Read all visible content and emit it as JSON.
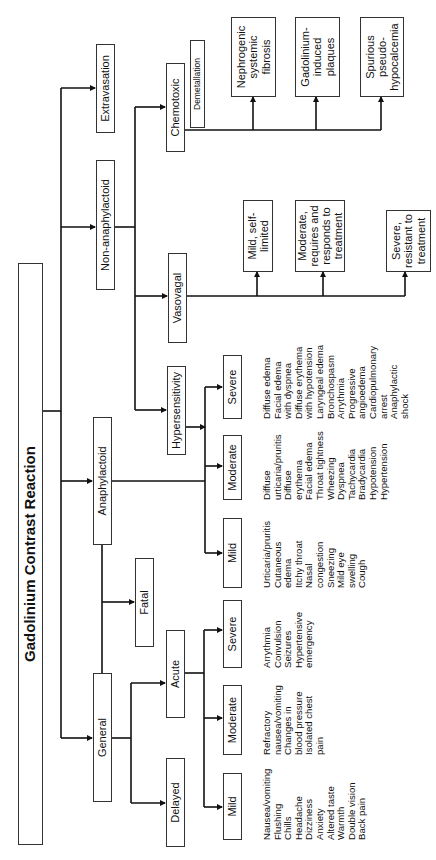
{
  "title": "Gadolinium Contrast Reaction",
  "categories": {
    "extravasation": "Extravasation",
    "non_anaphylactoid": "Non-anaphylactoid",
    "anaphylactoid": "Anaphylactoid",
    "general": "General"
  },
  "non_anaphylactoid": {
    "chemotoxic": "Chemotoxic",
    "demetallation": "Demetallation",
    "vasovagal": "Vasovagal",
    "chemotoxic_outcomes": [
      "Nephrogenic systemic fibrosis",
      "Gadolinium-induced plaques",
      "Spurious pseudo-hypocalcemia"
    ],
    "vasovagal_outcomes": [
      "Mild, self-limited",
      "Moderate, requires and responds to treatment",
      "Severe, resistant to treatment"
    ]
  },
  "anaphylactoid": {
    "hypersensitivity": "Hypersensitivity",
    "levels": {
      "mild": {
        "label": "Mild",
        "symptoms": [
          "Urticaria/pruritis",
          "Cutaneous",
          "edema",
          "Itchy throat",
          "Nasal",
          "congestion",
          "Sneezing",
          "Mild eye",
          "swelling",
          "Cough"
        ]
      },
      "moderate": {
        "label": "Moderate",
        "symptoms": [
          "Diffuse",
          "urticaria/pruritis",
          "Diffuse",
          "erythema",
          "Facial edema",
          "Throat tightness",
          "Wheezing",
          "Dyspnea",
          "Tachycardia",
          "Bradycardia",
          "Hypotension",
          "Hypertension"
        ]
      },
      "severe": {
        "label": "Severe",
        "symptoms": [
          "Diffuse edema",
          "Facial edema",
          "with dyspnea",
          "Diffuse erythema",
          "with hypotension",
          "Laryngeal edema",
          "Bronchospasm",
          "Arrythmia",
          "Progressive",
          "angioedema",
          "Cardiopulmonary",
          "arrest",
          "Anaphylactic",
          "shock"
        ]
      }
    }
  },
  "general": {
    "fatal": "Fatal",
    "acute": "Acute",
    "delayed": "Delayed",
    "levels": {
      "mild": {
        "label": "Mild",
        "symptoms": [
          "Nausea/vomiting",
          "Flushing",
          "Chills",
          "Headache",
          "Dizziness",
          "Anxiety",
          "Altered taste",
          "Warmth",
          "Double vision",
          "Back pain"
        ]
      },
      "moderate": {
        "label": "Moderate",
        "symptoms": [
          "Refractory",
          "nausea/vomiting",
          "Changes in",
          "blood pressure",
          "Isolated chest",
          "pain"
        ]
      },
      "severe": {
        "label": "Severe",
        "symptoms": [
          "Arrythmia",
          "Convulsion",
          "Seizures",
          "Hypertensive",
          "emergency"
        ]
      }
    }
  }
}
